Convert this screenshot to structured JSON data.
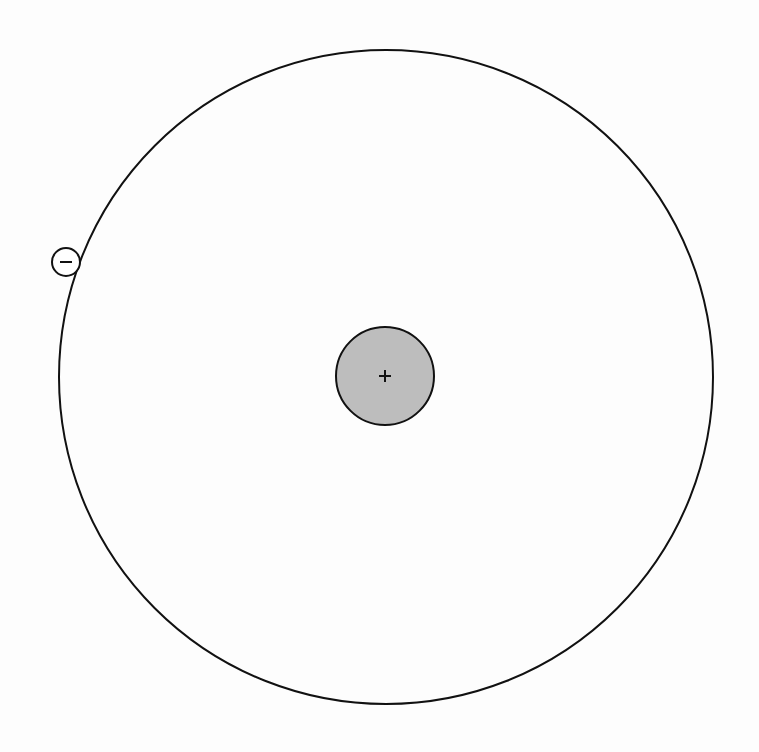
{
  "diagram": {
    "type": "atom-model",
    "background": "#fdfdfd",
    "stroke_color": "#111111",
    "orbit": {
      "cx": 386,
      "cy": 377,
      "r": 327,
      "stroke_width": 2
    },
    "nucleus": {
      "cx": 385,
      "cy": 376,
      "r": 49,
      "fill": "#bdbdbd",
      "stroke_width": 2,
      "charge_symbol": "+"
    },
    "electron": {
      "cx": 66,
      "cy": 262,
      "r": 14,
      "fill": "#ffffff",
      "stroke_width": 2,
      "charge_symbol": "−"
    }
  }
}
